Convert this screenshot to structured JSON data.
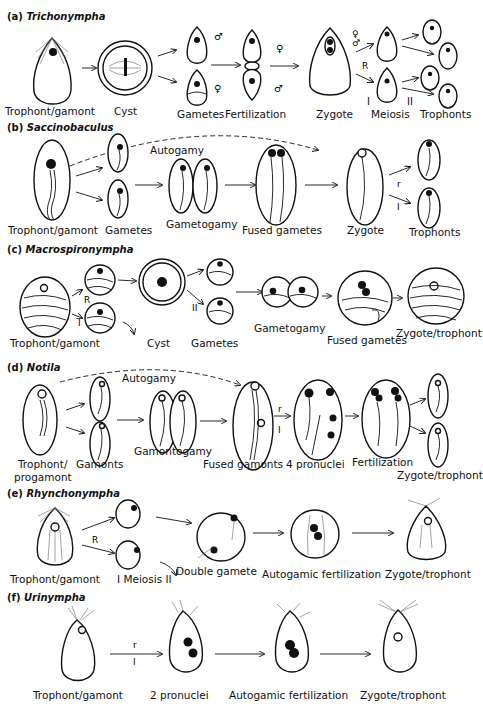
{
  "figure": {
    "panels": [
      {
        "id": "a",
        "letter": "(a)",
        "organism": "Trichonympha",
        "stages": [
          "Trophont/gamont",
          "Cyst",
          "Gametes",
          "Fertilization",
          "Zygote",
          "Meiosis",
          "Trophonts"
        ],
        "annotations": {
          "male": "♂",
          "female": "♀",
          "R": "R",
          "I": "I",
          "II": "II"
        }
      },
      {
        "id": "b",
        "letter": "(b)",
        "organism": "Saccinobaculus",
        "stages": [
          "Trophont/gamont",
          "Gametes",
          "Gametogamy",
          "Fused gametes",
          "Zygote",
          "Trophonts"
        ],
        "annotations": {
          "autogamy": "Autogamy",
          "r": "r",
          "I": "I"
        }
      },
      {
        "id": "c",
        "letter": "(c)",
        "organism": "Macrospironympha",
        "stages": [
          "Trophont/gamont",
          "Cyst",
          "Gametes",
          "Gametogamy",
          "Fused gametes",
          "Zygote/trophont"
        ],
        "annotations": {
          "R": "R",
          "I": "I",
          "II": "II"
        }
      },
      {
        "id": "d",
        "letter": "(d)",
        "organism": "Notila",
        "stages": [
          "Trophont/",
          "progamont",
          "Gamonts",
          "Gamontogamy",
          "Fused gamonts",
          "4 pronuclei",
          "Fertilization",
          "Zygote/trophont"
        ],
        "annotations": {
          "autogamy": "Autogamy",
          "r": "r",
          "I": "I"
        }
      },
      {
        "id": "e",
        "letter": "(e)",
        "organism": "Rhynchonympha",
        "stages": [
          "Trophont/gamont",
          "I  Meiosis II",
          "Double gamete",
          "Autogamic fertilization",
          "Zygote/trophont"
        ],
        "annotations": {
          "R": "R"
        }
      },
      {
        "id": "f",
        "letter": "(f)",
        "organism": "Urinympha",
        "stages": [
          "Trophont/gamont",
          "2 pronuclei",
          "Autogamic fertilization",
          "Zygote/trophont"
        ],
        "annotations": {
          "r": "r",
          "I": "I"
        }
      }
    ]
  }
}
